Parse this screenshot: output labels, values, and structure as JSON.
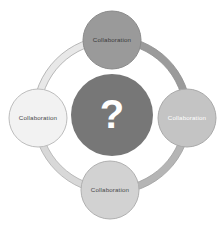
{
  "diagram": {
    "type": "circular-collaboration-wheel",
    "background_color": "#ffffff",
    "center": {
      "label": "?",
      "icon_name": "question-mark-glyph",
      "fill": "#777777",
      "text_color": "#ffffff",
      "cx": 112,
      "cy": 115,
      "r": 41
    },
    "ring": {
      "cx": 112,
      "cy": 115,
      "radius": 79,
      "thickness": 7,
      "outline_color": "#a8a8a8",
      "segments": [
        {
          "name": "top-left-arc",
          "fill": "#e8e8e8",
          "start_deg": 180,
          "end_deg": 270
        },
        {
          "name": "top-right-arc",
          "fill": "#9b9b9b",
          "start_deg": 270,
          "end_deg": 360
        },
        {
          "name": "bottom-right-arc",
          "fill": "#b5b5b5",
          "start_deg": 0,
          "end_deg": 90
        },
        {
          "name": "bottom-left-arc",
          "fill": "#d8d8d8",
          "start_deg": 90,
          "end_deg": 180
        }
      ]
    },
    "nodes": [
      {
        "position": "top",
        "label": "Collaboration",
        "fill": "#9a9a9a",
        "stroke": "#8a8a8a",
        "text_color": "#3a3a3a",
        "cx": 112,
        "cy": 40,
        "r": 29
      },
      {
        "position": "right",
        "label": "Collaboration",
        "fill": "#c4c4c4",
        "stroke": "#a9a9a9",
        "text_color": "#ffffff",
        "cx": 187,
        "cy": 118,
        "r": 29
      },
      {
        "position": "bottom",
        "label": "Collaboration",
        "fill": "#d2d2d2",
        "stroke": "#b0b0b0",
        "text_color": "#4a4a4a",
        "cx": 110,
        "cy": 190,
        "r": 29
      },
      {
        "position": "left",
        "label": "Collaboration",
        "fill": "#f2f2f2",
        "stroke": "#bdbdbd",
        "text_color": "#4a4a4a",
        "cx": 38,
        "cy": 118,
        "r": 29
      }
    ]
  }
}
